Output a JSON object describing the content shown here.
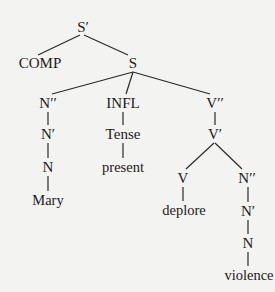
{
  "tree": {
    "root": {
      "id": "s-bar",
      "label": "S′",
      "x": 83,
      "y": 27
    },
    "nodes": [
      {
        "id": "s-bar",
        "label": "S′",
        "x": 83,
        "y": 27
      },
      {
        "id": "comp",
        "label": "COMP",
        "x": 40,
        "y": 63
      },
      {
        "id": "s",
        "label": "S",
        "x": 133,
        "y": 63
      },
      {
        "id": "n-double-bar-subj",
        "label": "N′′",
        "x": 48,
        "y": 103
      },
      {
        "id": "infl",
        "label": "INFL",
        "x": 123,
        "y": 103
      },
      {
        "id": "v-double-bar",
        "label": "V′′",
        "x": 215,
        "y": 103
      },
      {
        "id": "n-bar-subj",
        "label": "N′",
        "x": 48,
        "y": 134
      },
      {
        "id": "tense",
        "label": "Tense",
        "x": 123,
        "y": 134
      },
      {
        "id": "v-bar",
        "label": "V′",
        "x": 215,
        "y": 134
      },
      {
        "id": "n-subj",
        "label": "N",
        "x": 48,
        "y": 167
      },
      {
        "id": "present",
        "label": "present",
        "x": 123,
        "y": 167
      },
      {
        "id": "v",
        "label": "V",
        "x": 183,
        "y": 178
      },
      {
        "id": "n-double-bar-obj",
        "label": "N′′",
        "x": 247,
        "y": 178
      },
      {
        "id": "mary",
        "label": "Mary",
        "x": 48,
        "y": 200
      },
      {
        "id": "deplore",
        "label": "deplore",
        "x": 184,
        "y": 210
      },
      {
        "id": "n-bar-obj",
        "label": "N′",
        "x": 248,
        "y": 211
      },
      {
        "id": "n-obj",
        "label": "N",
        "x": 248,
        "y": 243
      },
      {
        "id": "violence",
        "label": "violence",
        "x": 249,
        "y": 275
      }
    ],
    "edges": [
      {
        "from": [
          80,
          35
        ],
        "to": [
          38,
          55
        ]
      },
      {
        "from": [
          84,
          35
        ],
        "to": [
          128,
          55
        ]
      },
      {
        "from": [
          133,
          72
        ],
        "to": [
          52,
          94
        ]
      },
      {
        "from": [
          133,
          72
        ],
        "to": [
          126,
          94
        ]
      },
      {
        "from": [
          133,
          72
        ],
        "to": [
          210,
          94
        ]
      },
      {
        "from": [
          48,
          112
        ],
        "to": [
          48,
          125
        ]
      },
      {
        "from": [
          48,
          143
        ],
        "to": [
          48,
          158
        ]
      },
      {
        "from": [
          48,
          176
        ],
        "to": [
          48,
          191
        ]
      },
      {
        "from": [
          123,
          112
        ],
        "to": [
          123,
          125
        ]
      },
      {
        "from": [
          123,
          143
        ],
        "to": [
          123,
          158
        ]
      },
      {
        "from": [
          215,
          112
        ],
        "to": [
          215,
          125
        ]
      },
      {
        "from": [
          214,
          143
        ],
        "to": [
          186,
          169
        ]
      },
      {
        "from": [
          215,
          143
        ],
        "to": [
          242,
          169
        ]
      },
      {
        "from": [
          183,
          187
        ],
        "to": [
          183,
          201
        ]
      },
      {
        "from": [
          248,
          187
        ],
        "to": [
          248,
          202
        ]
      },
      {
        "from": [
          248,
          220
        ],
        "to": [
          248,
          234
        ]
      },
      {
        "from": [
          248,
          252
        ],
        "to": [
          248,
          266
        ]
      }
    ]
  }
}
